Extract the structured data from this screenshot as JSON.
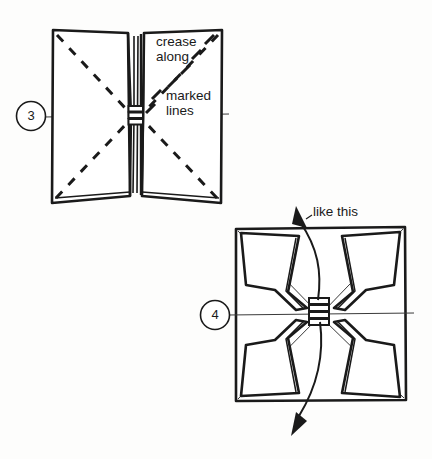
{
  "figure": {
    "background_color": "#fdfdfc",
    "ink_color": "#1a1a1a"
  },
  "steps": [
    {
      "number": "3",
      "name": "step-3",
      "description": "Two splayed panels joined at a central pleat, with dashed diagonal crease lines running corner to center on each panel and a horizontal reference line through the middle.",
      "annotations": [
        {
          "name": "crease-along-marked-lines",
          "lines": [
            "crease",
            "along",
            "marked",
            "lines"
          ]
        }
      ]
    },
    {
      "number": "4",
      "name": "step-4",
      "description": "A square with thin diagonals from each corner to the center; upper and lower flaps pulled out from the central pleat, with arrows showing the pull direction.",
      "annotations": [
        {
          "name": "like-this",
          "lines": [
            "like this"
          ]
        }
      ]
    }
  ],
  "labels": {
    "crease": "crease",
    "along": "along",
    "marked": "marked",
    "lines": "lines",
    "like_this": "like this",
    "step3_number": "3",
    "step4_number": "4"
  },
  "colors": {
    "ink": "#1a1a1a",
    "thin_line": "#3a3a3a",
    "paper": "#ffffff",
    "page": "#fdfdfc"
  }
}
